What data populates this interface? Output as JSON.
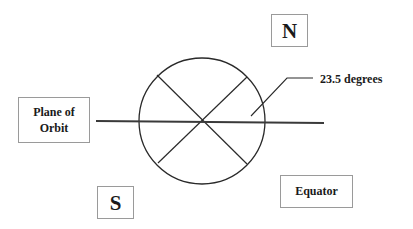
{
  "diagram": {
    "labels": {
      "north": "N",
      "south": "S",
      "plane_of_orbit_line1": "Plane of",
      "plane_of_orbit_line2": "Orbit",
      "equator": "Equator",
      "tilt_angle": "23.5 degrees"
    },
    "tilt_degrees": 23.5,
    "colors": {
      "line": "#2a2a2a",
      "box_border": "#9a9a9a",
      "text": "#1a1a1a",
      "background": "#ffffff"
    }
  }
}
